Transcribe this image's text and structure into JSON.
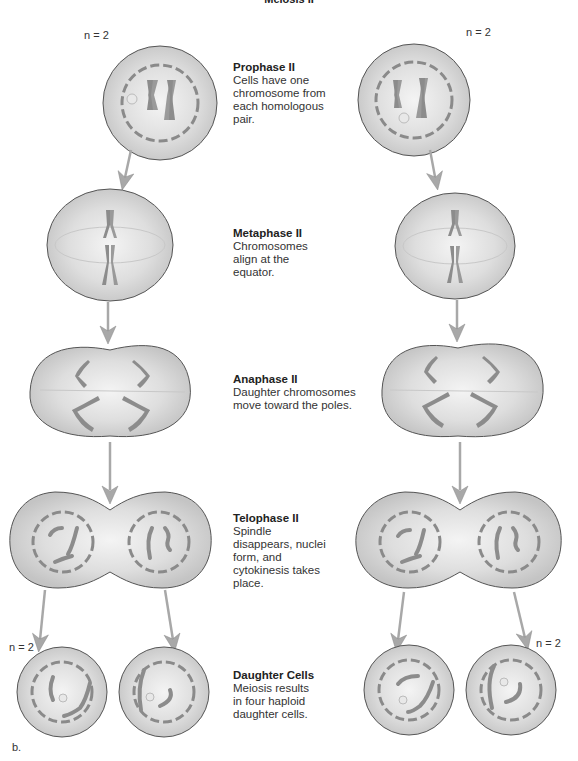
{
  "figure": {
    "title": "Meiosis II",
    "panel_letter": "b.",
    "ploidy_label": "n = 2",
    "colors": {
      "cell_fill": "#d4d4d4",
      "cell_center": "#f2f2f2",
      "cell_outline": "#555555",
      "nuclear_envelope": "#8a8a8a",
      "chromosome": "#8c8c8c",
      "arrow": "#a8a8a8",
      "text": "#222222"
    },
    "stages": [
      {
        "name": "Prophase II",
        "description": "Cells have one chromosome from each homologous pair."
      },
      {
        "name": "Metaphase II",
        "description": "Chromosomes align at the equator."
      },
      {
        "name": "Anaphase II",
        "description": "Daughter chromosomes move toward the poles."
      },
      {
        "name": "Telophase II",
        "description": "Spindle disappears, nuclei form, and cytokinesis takes place."
      },
      {
        "name": "Daughter Cells",
        "description": "Meiosis results in four haploid daughter cells."
      }
    ]
  }
}
